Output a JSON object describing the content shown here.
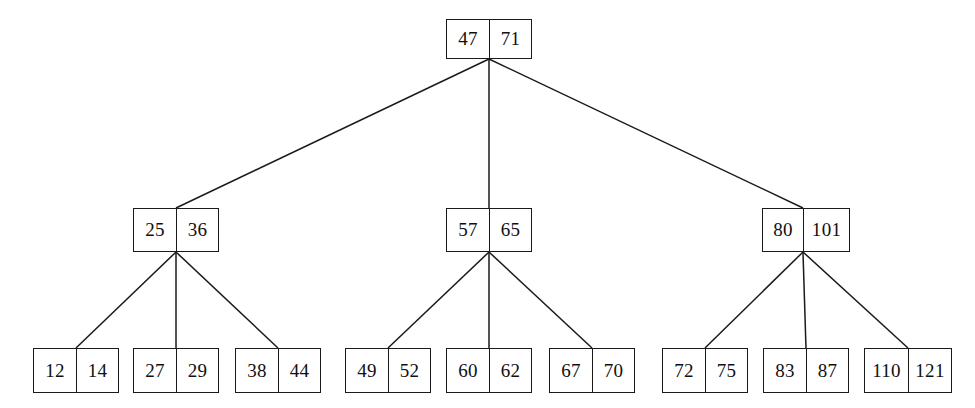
{
  "diagram": {
    "background_color": "#ffffff",
    "line_color": "#1a1a1a",
    "text_color": "#101010",
    "levels": 3,
    "nodes": [
      {
        "id": "root",
        "name": "root-node",
        "level": 0,
        "keys": [
          "47",
          "71"
        ],
        "x": 446,
        "y": 19,
        "width": 86,
        "height": 40,
        "cell_widths": [
          43,
          43
        ]
      },
      {
        "id": "internal-left",
        "name": "internal-node-left",
        "level": 1,
        "keys": [
          "25",
          "36"
        ],
        "x": 133,
        "y": 208,
        "width": 86,
        "height": 44,
        "cell_widths": [
          43,
          43
        ]
      },
      {
        "id": "internal-center",
        "name": "internal-node-center",
        "level": 1,
        "keys": [
          "57",
          "65"
        ],
        "x": 446,
        "y": 208,
        "width": 86,
        "height": 44,
        "cell_widths": [
          43,
          43
        ]
      },
      {
        "id": "internal-right",
        "name": "internal-node-right",
        "level": 1,
        "keys": [
          "80",
          "101"
        ],
        "x": 762,
        "y": 208,
        "width": 88,
        "height": 44,
        "cell_widths": [
          41,
          47
        ]
      },
      {
        "id": "leaf-1",
        "name": "leaf-node-12-14",
        "level": 2,
        "keys": [
          "12",
          "14"
        ],
        "x": 33,
        "y": 348,
        "width": 86,
        "height": 45,
        "cell_widths": [
          43,
          43
        ]
      },
      {
        "id": "leaf-2",
        "name": "leaf-node-27-29",
        "level": 2,
        "keys": [
          "27",
          "29"
        ],
        "x": 133,
        "y": 348,
        "width": 86,
        "height": 45,
        "cell_widths": [
          43,
          43
        ]
      },
      {
        "id": "leaf-3",
        "name": "leaf-node-38-44",
        "level": 2,
        "keys": [
          "38",
          "44"
        ],
        "x": 235,
        "y": 348,
        "width": 86,
        "height": 45,
        "cell_widths": [
          43,
          43
        ]
      },
      {
        "id": "leaf-4",
        "name": "leaf-node-49-52",
        "level": 2,
        "keys": [
          "49",
          "52"
        ],
        "x": 345,
        "y": 348,
        "width": 86,
        "height": 45,
        "cell_widths": [
          43,
          43
        ]
      },
      {
        "id": "leaf-5",
        "name": "leaf-node-60-62",
        "level": 2,
        "keys": [
          "60",
          "62"
        ],
        "x": 446,
        "y": 348,
        "width": 86,
        "height": 45,
        "cell_widths": [
          43,
          43
        ]
      },
      {
        "id": "leaf-6",
        "name": "leaf-node-67-70",
        "level": 2,
        "keys": [
          "67",
          "70"
        ],
        "x": 549,
        "y": 348,
        "width": 86,
        "height": 45,
        "cell_widths": [
          43,
          43
        ]
      },
      {
        "id": "leaf-7",
        "name": "leaf-node-72-75",
        "level": 2,
        "keys": [
          "72",
          "75"
        ],
        "x": 662,
        "y": 348,
        "width": 86,
        "height": 45,
        "cell_widths": [
          43,
          43
        ]
      },
      {
        "id": "leaf-8",
        "name": "leaf-node-83-87",
        "level": 2,
        "keys": [
          "83",
          "87"
        ],
        "x": 763,
        "y": 348,
        "width": 86,
        "height": 45,
        "cell_widths": [
          43,
          43
        ]
      },
      {
        "id": "leaf-9",
        "name": "leaf-node-110-121",
        "level": 2,
        "keys": [
          "110",
          "121"
        ],
        "x": 864,
        "y": 348,
        "width": 88,
        "height": 45,
        "cell_widths": [
          44,
          44
        ]
      },
      {
        "id": "leaf-9",
        "name": "leaf-node-110-121",
        "level": 2,
        "keys": [
          "110",
          "121"
        ],
        "x": 864,
        "y": 348,
        "width": 88,
        "height": 45,
        "cell_widths": [
          44,
          44
        ]
      }
    ],
    "edges": [
      {
        "name": "edge-root-to-internal-left",
        "from": "root",
        "to": "internal-left",
        "x1": 489,
        "y1": 59,
        "x2": 176,
        "y2": 208
      },
      {
        "name": "edge-root-to-internal-center",
        "from": "root",
        "to": "internal-center",
        "x1": 489,
        "y1": 59,
        "x2": 489,
        "y2": 208
      },
      {
        "name": "edge-root-to-internal-right",
        "from": "root",
        "to": "internal-right",
        "x1": 489,
        "y1": 59,
        "x2": 803,
        "y2": 208
      },
      {
        "name": "edge-internal-left-to-leaf-1",
        "from": "internal-left",
        "to": "leaf-1",
        "x1": 176,
        "y1": 252,
        "x2": 76,
        "y2": 348
      },
      {
        "name": "edge-internal-left-to-leaf-2",
        "from": "internal-left",
        "to": "leaf-2",
        "x1": 176,
        "y1": 252,
        "x2": 176,
        "y2": 348
      },
      {
        "name": "edge-internal-left-to-leaf-3",
        "from": "internal-left",
        "to": "leaf-3",
        "x1": 176,
        "y1": 252,
        "x2": 278,
        "y2": 348
      },
      {
        "name": "edge-internal-center-to-leaf-4",
        "from": "internal-center",
        "to": "leaf-4",
        "x1": 489,
        "y1": 252,
        "x2": 388,
        "y2": 348
      },
      {
        "name": "edge-internal-center-to-leaf-5",
        "from": "internal-center",
        "to": "leaf-5",
        "x1": 489,
        "y1": 252,
        "x2": 489,
        "y2": 348
      },
      {
        "name": "edge-internal-center-to-leaf-6",
        "from": "internal-center",
        "to": "leaf-6",
        "x1": 489,
        "y1": 252,
        "x2": 592,
        "y2": 348
      },
      {
        "name": "edge-internal-right-to-leaf-7",
        "from": "internal-right",
        "to": "leaf-7",
        "x1": 803,
        "y1": 252,
        "x2": 705,
        "y2": 348
      },
      {
        "name": "edge-internal-right-to-leaf-8",
        "from": "internal-right",
        "to": "leaf-8",
        "x1": 803,
        "y1": 252,
        "x2": 806,
        "y2": 348
      },
      {
        "name": "edge-internal-right-to-leaf-9",
        "from": "internal-right",
        "to": "leaf-9",
        "x1": 803,
        "y1": 252,
        "x2": 908,
        "y2": 348
      }
    ]
  }
}
